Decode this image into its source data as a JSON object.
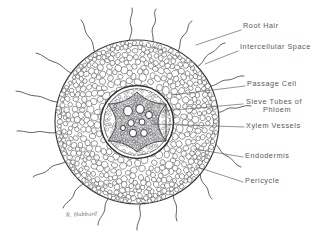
{
  "figure": {
    "kind": "botanical-cross-section-diagram",
    "background_color": "#ffffff",
    "ink_color": "#3a3a3d",
    "label_color": "#59595c",
    "signature": "R. Hubbard"
  },
  "labels": [
    {
      "id": "root-hair",
      "text": "Root Hair",
      "x": 243,
      "y": 26,
      "leader": {
        "x1": 241,
        "y1": 32,
        "x2": 196,
        "y2": 46
      }
    },
    {
      "id": "intercellular-space",
      "text": "Intercellular Space",
      "x": 240,
      "y": 47,
      "leader": {
        "x1": 238,
        "y1": 53,
        "x2": 203,
        "y2": 66
      }
    },
    {
      "id": "passage-cell",
      "text": "Passage Cell",
      "x": 247,
      "y": 84,
      "leader": {
        "x1": 245,
        "y1": 88,
        "x2": 172,
        "y2": 95
      }
    },
    {
      "id": "sieve-tubes",
      "line1": "Sieve  Tubes  of",
      "line2": "Phloem",
      "x": 245,
      "y": 102,
      "leader": {
        "x1": 243,
        "y1": 106,
        "x2": 162,
        "y2": 112
      }
    },
    {
      "id": "xylem-vessels",
      "text": "Xylem Vessels",
      "x": 246,
      "y": 126,
      "leader": {
        "x1": 244,
        "y1": 129,
        "x2": 154,
        "y2": 123
      }
    },
    {
      "id": "endodermis",
      "text": "Endodermis",
      "x": 245,
      "y": 156,
      "leader": {
        "x1": 243,
        "y1": 159,
        "x2": 193,
        "y2": 150
      }
    },
    {
      "id": "pericycle",
      "text": "Pericycle",
      "x": 245,
      "y": 181,
      "leader": {
        "x1": 243,
        "y1": 184,
        "x2": 196,
        "y2": 168
      }
    }
  ],
  "chart_data": {
    "type": "diagram",
    "structures": [
      {
        "name": "epidermis",
        "shape": "outer-ring",
        "center": [
          137,
          122
        ],
        "radius": 82
      },
      {
        "name": "cortex",
        "shape": "cell-field",
        "center": [
          137,
          122
        ],
        "radius_outer": 80,
        "radius_inner": 36,
        "cell_count": 520
      },
      {
        "name": "endodermis",
        "shape": "ring",
        "center": [
          137,
          122
        ],
        "radius": 36
      },
      {
        "name": "pericycle",
        "shape": "ring",
        "center": [
          137,
          122
        ],
        "radius": 33
      },
      {
        "name": "stele",
        "shape": "cell-field",
        "center": [
          137,
          122
        ],
        "radius": 33,
        "cell_count": 180
      },
      {
        "name": "xylem",
        "shape": "x-star",
        "center": [
          137,
          122
        ],
        "arm_count": 4,
        "arm_radius": 30
      },
      {
        "name": "xylem-vessels",
        "shape": "lumens",
        "count": 7
      },
      {
        "name": "root-hairs",
        "shape": "wavy-tubes",
        "count": 16
      }
    ]
  }
}
